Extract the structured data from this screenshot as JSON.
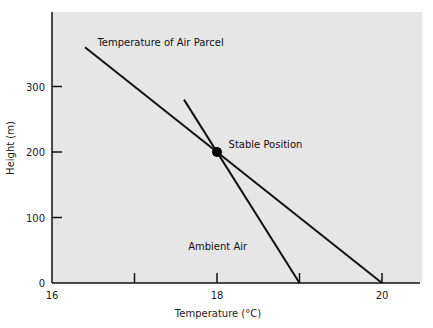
{
  "chart_data": {
    "type": "line",
    "title": "",
    "xlabel": "Temperature (°C)",
    "ylabel": "Height (m)",
    "xlim": [
      16,
      21.1
    ],
    "ylim": [
      0,
      415
    ],
    "x_ticks": [
      16,
      17,
      18,
      19,
      20
    ],
    "x_tick_labels": [
      "16",
      "",
      "18",
      "",
      "20"
    ],
    "y_ticks": [
      0,
      100,
      200,
      300
    ],
    "y_tick_labels": [
      "0",
      "100",
      "200",
      "300"
    ],
    "grid": false,
    "legend": "none (inline labels)",
    "background": "#e6e6e6",
    "series": [
      {
        "name": "Temperature of Air Parcel",
        "points": [
          [
            16.4,
            360
          ],
          [
            20.0,
            0
          ]
        ],
        "color": "#111111"
      },
      {
        "name": "Ambient Air",
        "points": [
          [
            17.6,
            280
          ],
          [
            19.0,
            0
          ]
        ],
        "color": "#111111"
      }
    ],
    "markers": [
      {
        "name": "Stable Position",
        "x": 18,
        "y": 200
      }
    ],
    "annotations": [
      {
        "text": "Temperature of Air Parcel",
        "x": 16.55,
        "y": 362
      },
      {
        "text": "Stable Position",
        "x": 18.14,
        "y": 206
      },
      {
        "text": "Ambient Air",
        "x": 17.65,
        "y": 51
      }
    ]
  }
}
